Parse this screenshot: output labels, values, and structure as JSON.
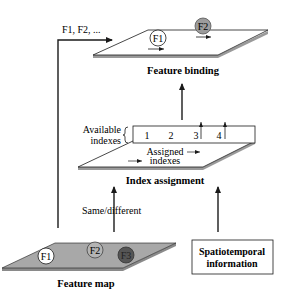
{
  "diagram": {
    "top_stage": {
      "label": "Feature binding",
      "features": [
        "F1",
        "F2"
      ],
      "input_label": "F1, F2, ..."
    },
    "middle_stage": {
      "label": "Index assignment",
      "available_label_line1": "Available",
      "available_label_line2": "indexes",
      "index_numbers": [
        "1",
        "2",
        "3",
        "4"
      ],
      "assigned_label_line1": "Assigned",
      "assigned_label_line2": "indexes"
    },
    "bottom_stage": {
      "feature_map_label": "Feature map",
      "features": [
        "F1",
        "F2",
        "F3"
      ],
      "same_different_label": "Same/different",
      "spatiotemporal_line1": "Spatiotemporal",
      "spatiotemporal_line2": "information"
    },
    "colors": {
      "line": "#1a1a1a",
      "plane_edge": "#9a9a9a",
      "feature_map_fill": "#a8a8a8",
      "f2_top_fill": "#9c9c9c",
      "f2_map_fill": "#b4b4b4",
      "f3_map_fill": "#555555"
    }
  }
}
